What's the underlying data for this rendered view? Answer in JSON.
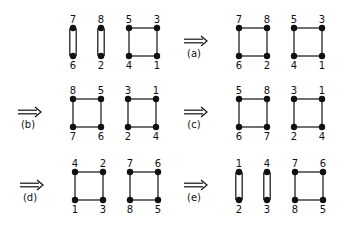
{
  "diagram": {
    "colors": {
      "ink": "#111111",
      "background": "#ffffff"
    },
    "arrow_glyph": "⟹",
    "panels": [
      {
        "id": "initial",
        "step_label": "",
        "has_arrow": false,
        "origin": [
          73,
          28
        ],
        "groups": [
          {
            "type": "pair",
            "top": "7",
            "bottom": "6"
          },
          {
            "type": "pair",
            "top": "8",
            "bottom": "2"
          },
          {
            "type": "square",
            "tl": "5",
            "tr": "3",
            "bl": "4",
            "br": "1"
          }
        ]
      },
      {
        "id": "a",
        "step_label": "(a)",
        "has_arrow": true,
        "origin": [
          239,
          28
        ],
        "groups": [
          {
            "type": "square",
            "tl": "7",
            "tr": "8",
            "bl": "6",
            "br": "2"
          },
          {
            "type": "square",
            "tl": "5",
            "tr": "3",
            "bl": "4",
            "br": "1"
          }
        ]
      },
      {
        "id": "b",
        "step_label": "(b)",
        "has_arrow": true,
        "origin": [
          73,
          99
        ],
        "groups": [
          {
            "type": "square",
            "tl": "8",
            "tr": "5",
            "bl": "7",
            "br": "6"
          },
          {
            "type": "square",
            "tl": "3",
            "tr": "1",
            "bl": "2",
            "br": "4"
          }
        ]
      },
      {
        "id": "c",
        "step_label": "(c)",
        "has_arrow": true,
        "origin": [
          239,
          99
        ],
        "groups": [
          {
            "type": "square",
            "tl": "5",
            "tr": "8",
            "bl": "6",
            "br": "7"
          },
          {
            "type": "square",
            "tl": "3",
            "tr": "1",
            "bl": "2",
            "br": "4"
          }
        ]
      },
      {
        "id": "d",
        "step_label": "(d)",
        "has_arrow": true,
        "origin": [
          75,
          172
        ],
        "groups": [
          {
            "type": "square",
            "tl": "4",
            "tr": "2",
            "bl": "1",
            "br": "3"
          },
          {
            "type": "square",
            "tl": "7",
            "tr": "6",
            "bl": "8",
            "br": "5"
          }
        ]
      },
      {
        "id": "e",
        "step_label": "(e)",
        "has_arrow": true,
        "origin": [
          239,
          172
        ],
        "groups": [
          {
            "type": "pair",
            "top": "1",
            "bottom": "2"
          },
          {
            "type": "pair",
            "top": "4",
            "bottom": "3"
          },
          {
            "type": "square",
            "tl": "7",
            "tr": "6",
            "bl": "8",
            "br": "5"
          }
        ]
      }
    ]
  }
}
